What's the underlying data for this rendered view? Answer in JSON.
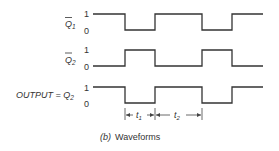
{
  "diagram": {
    "caption_prefix": "(b)",
    "caption_text": "Waveforms",
    "level_high": "1",
    "level_low": "0",
    "signals": [
      {
        "name": "Q",
        "subscript": "1",
        "overbar": true,
        "prefix": ""
      },
      {
        "name": "Q",
        "subscript": "2",
        "overbar": true,
        "prefix": ""
      },
      {
        "name": "Q",
        "subscript": "2",
        "overbar": false,
        "prefix": "OUTPUT = "
      }
    ],
    "intervals": [
      {
        "label": "t",
        "subscript": "1"
      },
      {
        "label": "t",
        "subscript": "2"
      }
    ],
    "waveforms": {
      "q1_bar": "1 -> 0 -> 1 -> 0 -> 1",
      "q2_bar": "0 -> 1 -> 0 -> 1 -> 0",
      "output_q2": "1 -> 0 -> 1 -> 0 -> 1"
    }
  }
}
